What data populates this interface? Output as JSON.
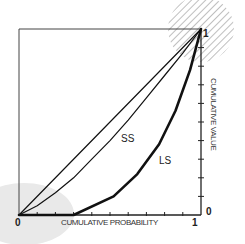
{
  "chart_data": {
    "type": "line",
    "title": "",
    "xlabel": "CUMULATIVE PROBABILITY",
    "ylabel": "CUMULATIVE VALUE",
    "xlim": [
      0,
      1
    ],
    "ylim": [
      0,
      1
    ],
    "x_tick_labels": [
      "0",
      "1"
    ],
    "y_tick_labels": [
      "0",
      "1"
    ],
    "x_minor_ticks": 10,
    "y_minor_ticks": 10,
    "grid": false,
    "legend": "none",
    "y_axis_position": "right",
    "series": [
      {
        "name": "Equality diagonal",
        "style": "thin",
        "x": [
          0,
          1
        ],
        "y": [
          0,
          1
        ]
      },
      {
        "name": "SS",
        "style": "thin",
        "x": [
          0,
          0.1,
          0.2,
          0.3,
          0.4,
          0.5,
          0.6,
          0.7,
          0.8,
          0.9,
          1.0
        ],
        "y": [
          0,
          0.05,
          0.12,
          0.2,
          0.3,
          0.4,
          0.51,
          0.63,
          0.75,
          0.87,
          1.0
        ]
      },
      {
        "name": "LS",
        "style": "thick",
        "x": [
          0,
          0.3,
          0.52,
          0.65,
          0.77,
          0.86,
          0.94,
          1.0
        ],
        "y": [
          0,
          0,
          0.1,
          0.22,
          0.38,
          0.56,
          0.78,
          1.0
        ]
      }
    ],
    "annotations": [
      {
        "type": "hatched-circle",
        "at": [
          1,
          1
        ],
        "note": "region highlighted at top-right corner"
      },
      {
        "type": "shaded-ellipse",
        "at": [
          0,
          0
        ],
        "note": "light gray region at origin"
      }
    ]
  },
  "labels": {
    "x_zero": "0",
    "x_one": "1",
    "y_zero": "0",
    "y_one": "1",
    "xlabel": "CUMULATIVE PROBABILITY",
    "ylabel": "CUMULATIVE VALUE",
    "ss": "SS",
    "ls": "LS"
  },
  "colors": {
    "line": "#111111",
    "hatch": "#8a8a8a",
    "shade": "#e6e6e6",
    "frame": "#333333"
  }
}
